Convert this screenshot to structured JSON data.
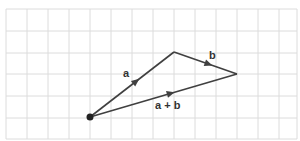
{
  "diagram": {
    "title": "",
    "grid": {
      "color": "#dcdcdc",
      "x_lines": [
        6,
        27,
        48,
        69,
        90,
        111,
        132,
        153,
        174,
        195,
        216,
        237,
        258,
        279,
        297
      ],
      "y_lines": [
        9,
        31,
        53,
        74,
        96,
        118,
        139
      ]
    },
    "vector_color": "#404040",
    "points": {
      "origin": {
        "x": 90,
        "y": 117
      },
      "tip_a": {
        "x": 174,
        "y": 52
      },
      "tip_sum": {
        "x": 237,
        "y": 74
      }
    },
    "vectors": [
      {
        "id": "a",
        "label": "a",
        "from": "origin",
        "to": "tip_a"
      },
      {
        "id": "b",
        "label": "b",
        "from": "tip_a",
        "to": "tip_sum"
      },
      {
        "id": "sum",
        "label": "a + b",
        "from": "origin",
        "to": "tip_sum"
      }
    ],
    "labels": {
      "a": "a",
      "b": "b",
      "sum": "a + b"
    }
  }
}
